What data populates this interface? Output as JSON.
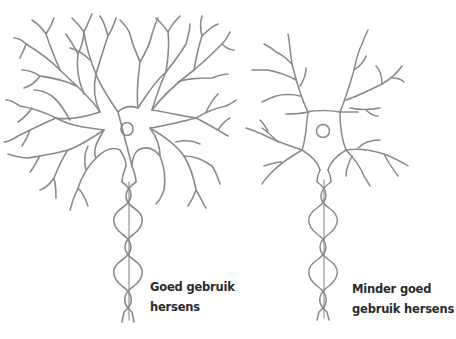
{
  "figure": {
    "stroke_color": "#8a8a8a",
    "text_color": "#2b2b2b",
    "background": "#ffffff"
  },
  "neurons": [
    {
      "id": "left",
      "caption_lines": [
        "Goed gebruik",
        "hersens"
      ],
      "branching": "dense"
    },
    {
      "id": "right",
      "caption_lines": [
        "Minder goed",
        "gebruik hersens"
      ],
      "branching": "sparse"
    }
  ]
}
